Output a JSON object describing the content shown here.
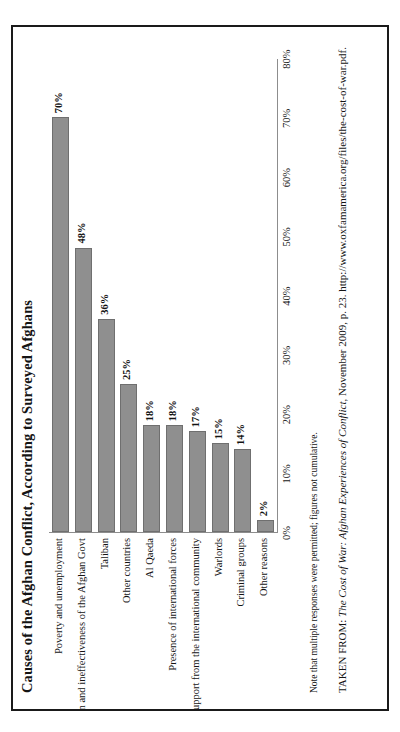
{
  "figure": {
    "title": "Causes of the Afghan Conflict, According to Surveyed Afghans",
    "note": "Note that multiple responses were permitted; figures not cumulative.",
    "citation": {
      "prefix": "TAKEN FROM: ",
      "source_italic": "The Cost of War: Afghan Experiences of Conflict",
      "suffix": ", November 2009, p. 23. http://www.oxfamamerica.org/files/the-cost-of-war.pdf."
    },
    "colors": {
      "bar_fill": "#8f8f8f",
      "bar_stroke": "#6f6f6f",
      "axis": "#8d8d8d",
      "border": "#1a1a1a",
      "text": "#141414",
      "background": "#ffffff"
    }
  },
  "chart_data": {
    "type": "bar",
    "orientation": "vertical",
    "title": "Causes of the Afghan Conflict, According to Surveyed Afghans",
    "xlabel": "",
    "ylabel": "",
    "ylim": [
      0,
      80
    ],
    "grid": false,
    "legend": "none",
    "tick_labels": [
      "0%",
      "10%",
      "20%",
      "30%",
      "40%",
      "50%",
      "60%",
      "70%",
      "80%"
    ],
    "ticks": [
      0,
      10,
      20,
      30,
      40,
      50,
      60,
      70,
      80
    ],
    "categories": [
      "Poverty and unemployment",
      "Corruption and ineffectiveness of the Afghan Govt",
      "Taliban",
      "Other countries",
      "Al Qaeda",
      "Presence of international forces",
      "Lack of support from the international community",
      "Warlords",
      "Criminal groups",
      "Other reasons"
    ],
    "values": [
      70,
      48,
      36,
      25,
      18,
      18,
      17,
      15,
      14,
      2
    ],
    "value_labels": [
      "70%",
      "48%",
      "36%",
      "25%",
      "18%",
      "18%",
      "17%",
      "15%",
      "14%",
      "2%"
    ]
  }
}
